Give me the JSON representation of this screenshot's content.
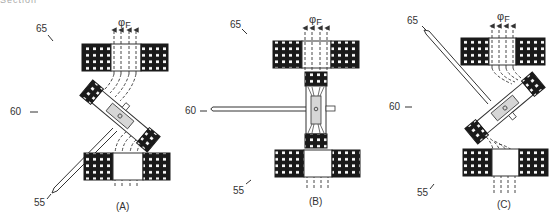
{
  "header": {
    "partial_text": "Section"
  },
  "colors": {
    "pad": "#1a1a1a",
    "dot": "#ffffff",
    "line": "#333333",
    "shade": "#d6d6d6"
  },
  "diagrams": [
    {
      "id": "A",
      "caption": "(A)",
      "flux_label": "φ",
      "flux_sub": "F",
      "labels": {
        "top": "65",
        "middle": "60",
        "bottom": "55"
      },
      "rotor_angle_deg": 40
    },
    {
      "id": "B",
      "caption": "(B)",
      "flux_label": "φ",
      "flux_sub": "F",
      "labels": {
        "top": "65",
        "middle": "60",
        "bottom": "55"
      },
      "rotor_angle_deg": 0
    },
    {
      "id": "C",
      "caption": "(C)",
      "flux_label": "φ",
      "flux_sub": "F",
      "labels": {
        "top": "65",
        "middle": "60",
        "bottom": "55"
      },
      "rotor_angle_deg": -40
    }
  ]
}
